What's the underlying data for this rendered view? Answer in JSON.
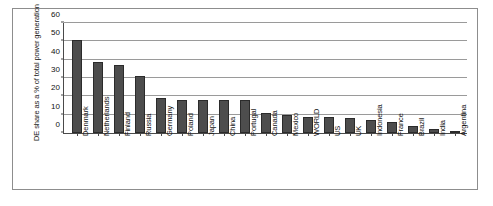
{
  "chart_data": {
    "type": "bar",
    "title": "",
    "xlabel": "",
    "ylabel": "DE share as a % of total power generation",
    "ylim": [
      0,
      60
    ],
    "yticks": [
      0,
      10,
      20,
      30,
      40,
      50,
      60
    ],
    "grid": true,
    "legend": false,
    "categories": [
      "Denmark",
      "Netherlands",
      "Finland",
      "Russia",
      "Germany",
      "Poland",
      "Japan",
      "China",
      "Portugal",
      "Canada",
      "Mexico",
      "WORLD",
      "US",
      "UK",
      "Indonesia",
      "France",
      "Brazil",
      "India",
      "Argentina"
    ],
    "values": [
      51,
      39,
      37,
      31,
      19,
      18,
      18,
      18,
      18,
      11,
      10,
      9,
      9,
      8,
      7,
      6,
      4,
      2,
      1
    ],
    "bar_color": "#4d4d4d",
    "bar_edge_color": "#2b2b2b",
    "grid_color": "#9a9a9a",
    "axis_color": "#4a4a4a",
    "frame_color": "#8d8d8d",
    "background": "#ffffff"
  }
}
